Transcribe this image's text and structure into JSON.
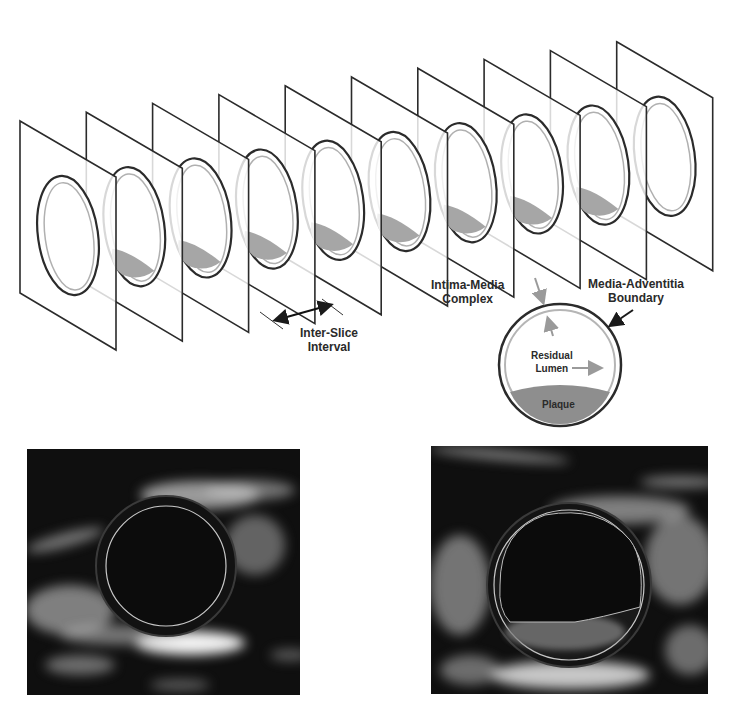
{
  "diagram": {
    "title": "",
    "slices": {
      "count": 10,
      "plaque_on_slice": [
        false,
        true,
        true,
        true,
        true,
        true,
        true,
        true,
        true,
        false
      ],
      "first_plane": {
        "left_x": 20,
        "top_left_y": 121,
        "bottom_left_y": 293,
        "right_x": 116,
        "top_right_y": 177,
        "bottom_right_y": 350
      },
      "step": {
        "dx": 66.3,
        "dy": -8.8
      }
    },
    "labels": {
      "inter_slice": [
        "Inter-Slice",
        "Interval"
      ],
      "intima_media": [
        "Intima-Media",
        "Complex"
      ],
      "media_adventitia": [
        "Media-Adventitia",
        "Boundary"
      ],
      "residual_lumen": [
        "Residual",
        "Lumen"
      ],
      "plaque": "Plaque"
    },
    "ultrasound_panels": [
      {
        "name": "ultrasound-normal",
        "x": 27,
        "y": 449,
        "w": 273,
        "h": 246,
        "lumen": "full-circle"
      },
      {
        "name": "ultrasound-plaque",
        "x": 431,
        "y": 446,
        "w": 277,
        "h": 248,
        "lumen": "with-plaque-boundary"
      }
    ],
    "colors": {
      "outline": "#2b2b2b",
      "inner_ring": "#a8a8a8",
      "plaque": "#9a9a9a",
      "ultrasound_bg": "#111111",
      "tissue": "#bdbdbd"
    }
  }
}
